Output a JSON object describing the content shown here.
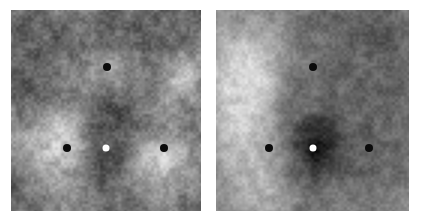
{
  "figure": {
    "type": "image-pair",
    "background_color": "#ffffff",
    "width": 423,
    "height": 222,
    "colormap": "grayscale",
    "panel_count": 2
  },
  "panels": [
    {
      "id": "left-panel",
      "name": "left-grayscale-map",
      "x": 11,
      "y": 10,
      "width": 190,
      "height": 201,
      "seed": 1487,
      "noise_amplitude": 17,
      "base_level": 126,
      "blobs": [
        {
          "cx": 0.12,
          "cy": 0.16,
          "rx": 0.3,
          "ry": 0.26,
          "amp": -34
        },
        {
          "cx": 0.52,
          "cy": 0.1,
          "rx": 0.26,
          "ry": 0.22,
          "amp": -40
        },
        {
          "cx": 0.86,
          "cy": 0.12,
          "rx": 0.24,
          "ry": 0.22,
          "amp": -30
        },
        {
          "cx": 0.5,
          "cy": 0.3,
          "rx": 0.2,
          "ry": 0.16,
          "amp": 46
        },
        {
          "cx": 0.92,
          "cy": 0.34,
          "rx": 0.18,
          "ry": 0.2,
          "amp": 54
        },
        {
          "cx": 0.08,
          "cy": 0.44,
          "rx": 0.22,
          "ry": 0.2,
          "amp": -26
        },
        {
          "cx": 0.5,
          "cy": 0.52,
          "rx": 0.22,
          "ry": 0.18,
          "amp": -48
        },
        {
          "cx": 0.26,
          "cy": 0.66,
          "rx": 0.27,
          "ry": 0.26,
          "amp": 72
        },
        {
          "cx": 0.5,
          "cy": 0.74,
          "rx": 0.15,
          "ry": 0.16,
          "amp": -78
        },
        {
          "cx": 0.8,
          "cy": 0.74,
          "rx": 0.24,
          "ry": 0.22,
          "amp": 66
        },
        {
          "cx": 0.97,
          "cy": 0.6,
          "rx": 0.14,
          "ry": 0.18,
          "amp": -34
        },
        {
          "cx": 0.04,
          "cy": 0.88,
          "rx": 0.2,
          "ry": 0.18,
          "amp": -20
        },
        {
          "cx": 0.55,
          "cy": 0.95,
          "rx": 0.26,
          "ry": 0.16,
          "amp": -22
        },
        {
          "cx": 0.3,
          "cy": 0.02,
          "rx": 0.16,
          "ry": 0.14,
          "amp": 22
        }
      ],
      "markers": [
        {
          "name": "marker-top",
          "kind": "dark",
          "x": 107,
          "y": 67,
          "d": 8
        },
        {
          "name": "marker-left",
          "kind": "dark",
          "x": 67,
          "y": 148,
          "d": 8
        },
        {
          "name": "marker-center",
          "kind": "light",
          "x": 106,
          "y": 148,
          "d": 7
        },
        {
          "name": "marker-right",
          "kind": "dark",
          "x": 164,
          "y": 148,
          "d": 8
        }
      ]
    },
    {
      "id": "right-panel",
      "name": "right-grayscale-map",
      "x": 216,
      "y": 10,
      "width": 193,
      "height": 201,
      "seed": 9213,
      "noise_amplitude": 13,
      "base_level": 122,
      "blobs": [
        {
          "cx": 0.18,
          "cy": 0.24,
          "rx": 0.22,
          "ry": 0.28,
          "amp": 78
        },
        {
          "cx": 0.14,
          "cy": 0.52,
          "rx": 0.2,
          "ry": 0.26,
          "amp": 60
        },
        {
          "cx": 0.16,
          "cy": 0.8,
          "rx": 0.22,
          "ry": 0.24,
          "amp": 52
        },
        {
          "cx": 0.03,
          "cy": 0.4,
          "rx": 0.14,
          "ry": 0.3,
          "amp": 30
        },
        {
          "cx": 0.52,
          "cy": 0.06,
          "rx": 0.26,
          "ry": 0.18,
          "amp": -16
        },
        {
          "cx": 0.82,
          "cy": 0.14,
          "rx": 0.26,
          "ry": 0.24,
          "amp": -24
        },
        {
          "cx": 0.98,
          "cy": 0.42,
          "rx": 0.2,
          "ry": 0.26,
          "amp": -22
        },
        {
          "cx": 0.62,
          "cy": 0.4,
          "rx": 0.24,
          "ry": 0.22,
          "amp": -26
        },
        {
          "cx": 0.5,
          "cy": 0.7,
          "rx": 0.17,
          "ry": 0.17,
          "amp": -74
        },
        {
          "cx": 0.52,
          "cy": 0.6,
          "rx": 0.12,
          "ry": 0.12,
          "amp": -46
        },
        {
          "cx": 0.82,
          "cy": 0.72,
          "rx": 0.24,
          "ry": 0.22,
          "amp": -28
        },
        {
          "cx": 0.46,
          "cy": 0.95,
          "rx": 0.24,
          "ry": 0.16,
          "amp": -18
        },
        {
          "cx": 0.3,
          "cy": 0.94,
          "rx": 0.18,
          "ry": 0.14,
          "amp": 26
        },
        {
          "cx": 0.97,
          "cy": 0.92,
          "rx": 0.16,
          "ry": 0.16,
          "amp": 18
        }
      ],
      "markers": [
        {
          "name": "marker-top",
          "kind": "dark",
          "x": 313,
          "y": 67,
          "d": 8
        },
        {
          "name": "marker-left",
          "kind": "dark",
          "x": 269,
          "y": 148,
          "d": 8
        },
        {
          "name": "marker-center",
          "kind": "light",
          "x": 313,
          "y": 148,
          "d": 7
        },
        {
          "name": "marker-right",
          "kind": "dark",
          "x": 369,
          "y": 148,
          "d": 8
        }
      ]
    }
  ]
}
